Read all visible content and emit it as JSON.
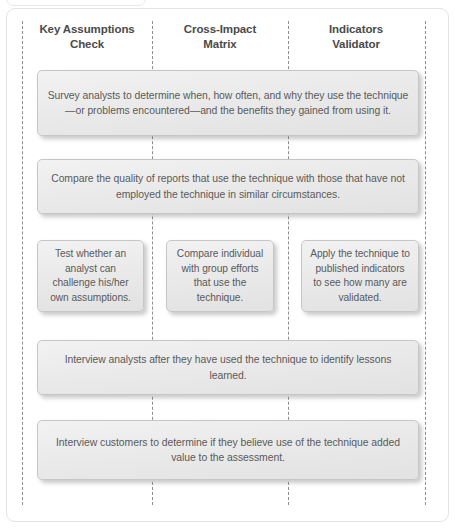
{
  "diagram": {
    "type": "matrix-flow-diagram",
    "columns": [
      {
        "id": "key-assumptions-check",
        "label": "Key Assumptions\nCheck",
        "line1": "Key Assumptions",
        "line2": "Check",
        "center_x": 87
      },
      {
        "id": "cross-impact-matrix",
        "label": "Cross-Impact\nMatrix",
        "line1": "Cross-Impact",
        "line2": "Matrix",
        "center_x": 220
      },
      {
        "id": "indicators-validator",
        "label": "Indicators\nValidator",
        "line1": "Indicators",
        "line2": "Validator",
        "center_x": 356
      }
    ],
    "dividers_x": [
      22,
      152,
      288,
      425
    ],
    "rows": [
      {
        "id": "row-survey-analysts",
        "span": "full",
        "text": "Survey analysts to determine when, how often, and why they use the technique—or problems encountered—and the benefits they gained from using it."
      },
      {
        "id": "row-compare-quality",
        "span": "full",
        "text": "Compare the quality of reports that use the technique with those that have not employed the technique in similar circumstances."
      },
      {
        "id": "row-per-column",
        "span": "split",
        "cells": [
          {
            "id": "cell-key-assumptions",
            "text": "Test whether an analyst can challenge his/her own assumptions."
          },
          {
            "id": "cell-cross-impact",
            "text": "Compare individual with group efforts that use the technique."
          },
          {
            "id": "cell-indicators",
            "text": "Apply the technique to published indicators to see how many are validated."
          }
        ]
      },
      {
        "id": "row-interview-analysts",
        "span": "full",
        "text": "Interview analysts after they have used the technique to identify lessons learned."
      },
      {
        "id": "row-interview-customers",
        "span": "full",
        "text": "Interview customers to determine if they believe use of the technique added value to the assessment."
      }
    ],
    "colors": {
      "box_fill_top": "#f2f2f2",
      "box_fill_bottom": "#e2e2e2",
      "box_border": "#c6c6c6",
      "text": "#5a5a5a",
      "header_text": "#4a4a4a",
      "divider": "#8d8d8d",
      "frame_border": "#e4e4e4",
      "background": "#ffffff"
    }
  }
}
